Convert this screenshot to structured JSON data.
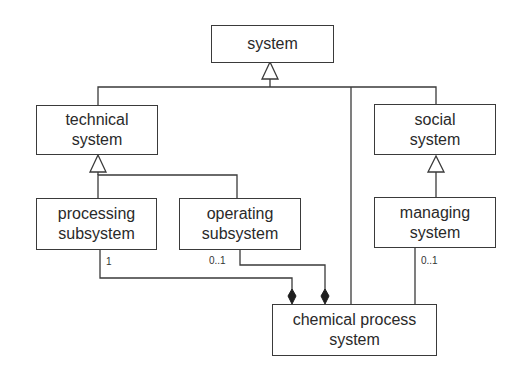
{
  "diagram": {
    "type": "UML class diagram",
    "classes": {
      "system": {
        "lines": [
          "system"
        ]
      },
      "technical_system": {
        "lines": [
          "technical",
          "system"
        ]
      },
      "social_system": {
        "lines": [
          "social",
          "system"
        ]
      },
      "processing_subsystem": {
        "lines": [
          "processing",
          "subsystem"
        ]
      },
      "operating_subsystem": {
        "lines": [
          "operating",
          "subsystem"
        ]
      },
      "managing_system": {
        "lines": [
          "managing",
          "system"
        ]
      },
      "chemical_process_system": {
        "lines": [
          "chemical process",
          "system"
        ]
      }
    },
    "multiplicities": {
      "processing_to_chemical": "1",
      "operating_to_chemical": "0..1",
      "managing_to_chemical": "0..1"
    },
    "relations": [
      {
        "kind": "generalization",
        "from": "technical system",
        "to": "system"
      },
      {
        "kind": "generalization",
        "from": "social system",
        "to": "system"
      },
      {
        "kind": "generalization",
        "from": "chemical process system",
        "to": "system"
      },
      {
        "kind": "generalization",
        "from": "processing subsystem",
        "to": "technical system"
      },
      {
        "kind": "generalization",
        "from": "operating subsystem",
        "to": "technical system"
      },
      {
        "kind": "generalization",
        "from": "managing system",
        "to": "social system"
      },
      {
        "kind": "composition",
        "whole": "chemical process system",
        "part": "processing subsystem",
        "multiplicity": "1"
      },
      {
        "kind": "composition",
        "whole": "chemical process system",
        "part": "operating subsystem",
        "multiplicity": "0..1"
      },
      {
        "kind": "association",
        "from": "chemical process system",
        "to": "managing system",
        "multiplicity": "0..1"
      }
    ]
  }
}
